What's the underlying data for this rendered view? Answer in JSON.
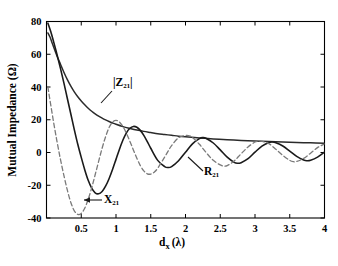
{
  "figure": {
    "background": "#ffffff",
    "axis_color": "#000000",
    "width": 338,
    "height": 266
  },
  "chart_data": {
    "type": "line",
    "title": "",
    "xlabel": "d_x (λ)",
    "xlabel_parts": {
      "base": "d",
      "sub": "x",
      "unit": "(λ)"
    },
    "ylabel": "Mutual Impedance (Ω)",
    "xlim": [
      0,
      4
    ],
    "ylim": [
      -40,
      80
    ],
    "xticks": [
      0,
      0.5,
      1,
      1.5,
      2,
      2.5,
      3,
      3.5,
      4
    ],
    "xticklabels": [
      "",
      "0.5",
      "1",
      "1.5",
      "2",
      "2.5",
      "3",
      "3.5",
      "4"
    ],
    "yticks": [
      -40,
      -20,
      0,
      20,
      40,
      60,
      80
    ],
    "yticklabels": [
      "-40",
      "-20",
      "0",
      "20",
      "40",
      "60",
      "80"
    ],
    "grid": false,
    "legend_position": "inline-annotations",
    "series": [
      {
        "name": "|Z21|",
        "label": "|Z₂₁|",
        "style": "solid",
        "color": "#2b2b2b",
        "width": 1.5,
        "description": "monotonically decaying magnitude envelope",
        "x": [
          0.02,
          0.05,
          0.08,
          0.12,
          0.16,
          0.2,
          0.25,
          0.3,
          0.35,
          0.4,
          0.45,
          0.5,
          0.55,
          0.6,
          0.65,
          0.7,
          0.75,
          0.8,
          0.85,
          0.9,
          0.95,
          1.0,
          1.1,
          1.2,
          1.3,
          1.4,
          1.5,
          1.6,
          1.7,
          1.8,
          1.9,
          2.0,
          2.2,
          2.4,
          2.6,
          2.8,
          3.0,
          3.2,
          3.4,
          3.6,
          3.8,
          4.0
        ],
        "y": [
          73.0,
          70.5,
          67.0,
          62.5,
          58.0,
          54.0,
          49.0,
          44.5,
          40.5,
          37.0,
          34.0,
          31.4,
          29.1,
          27.0,
          25.2,
          23.6,
          22.2,
          21.0,
          19.9,
          18.9,
          18.0,
          17.2,
          15.8,
          14.7,
          13.7,
          12.9,
          12.2,
          11.5,
          11.0,
          10.5,
          10.0,
          9.6,
          8.9,
          8.3,
          7.8,
          7.4,
          7.0,
          6.7,
          6.4,
          6.1,
          5.9,
          5.7
        ]
      },
      {
        "name": "R21",
        "label": "R₂₁",
        "style": "solid",
        "color": "#1a1a1a",
        "width": 1.6,
        "description": "real part, damped oscillation",
        "x": [
          0.02,
          0.06,
          0.1,
          0.15,
          0.2,
          0.25,
          0.3,
          0.35,
          0.4,
          0.45,
          0.5,
          0.55,
          0.6,
          0.65,
          0.7,
          0.75,
          0.8,
          0.85,
          0.9,
          0.95,
          1.0,
          1.05,
          1.1,
          1.15,
          1.2,
          1.25,
          1.3,
          1.35,
          1.4,
          1.45,
          1.5,
          1.6,
          1.7,
          1.75,
          1.8,
          1.9,
          2.0,
          2.1,
          2.2,
          2.25,
          2.3,
          2.4,
          2.5,
          2.6,
          2.7,
          2.75,
          2.8,
          2.9,
          3.0,
          3.1,
          3.2,
          3.25,
          3.3,
          3.4,
          3.5,
          3.6,
          3.7,
          3.75,
          3.8,
          3.9,
          4.0
        ],
        "y": [
          79.0,
          74.0,
          68.0,
          60.0,
          51.5,
          42.5,
          33.0,
          23.5,
          14.0,
          5.0,
          -3.0,
          -10.5,
          -17.0,
          -21.8,
          -24.6,
          -25.2,
          -23.8,
          -20.6,
          -16.0,
          -10.4,
          -4.2,
          2.0,
          7.6,
          12.0,
          14.8,
          15.9,
          15.4,
          13.5,
          10.5,
          6.7,
          2.6,
          -4.8,
          -8.6,
          -9.2,
          -8.6,
          -5.0,
          0.2,
          5.3,
          8.5,
          9.1,
          8.6,
          5.8,
          1.6,
          -2.8,
          -6.0,
          -6.6,
          -6.2,
          -3.8,
          0.2,
          3.9,
          6.1,
          6.4,
          6.0,
          4.0,
          0.8,
          -2.4,
          -4.6,
          -5.0,
          -4.7,
          -2.8,
          0.2
        ]
      },
      {
        "name": "X21",
        "label": "X₂₁",
        "style": "dashed",
        "color": "#7a7a7a",
        "width": 1.3,
        "description": "imaginary part, damped oscillation shifted in phase",
        "x": [
          0.02,
          0.05,
          0.1,
          0.15,
          0.2,
          0.25,
          0.3,
          0.35,
          0.4,
          0.45,
          0.5,
          0.55,
          0.6,
          0.65,
          0.7,
          0.75,
          0.8,
          0.85,
          0.9,
          0.95,
          1.0,
          1.05,
          1.1,
          1.15,
          1.2,
          1.25,
          1.3,
          1.35,
          1.4,
          1.45,
          1.5,
          1.55,
          1.6,
          1.7,
          1.75,
          1.8,
          1.9,
          2.0,
          2.05,
          2.1,
          2.2,
          2.3,
          2.4,
          2.5,
          2.55,
          2.6,
          2.7,
          2.8,
          2.9,
          3.0,
          3.05,
          3.1,
          3.2,
          3.3,
          3.4,
          3.5,
          3.55,
          3.6,
          3.7,
          3.8,
          3.9,
          4.0
        ],
        "y": [
          40.0,
          32.0,
          19.0,
          7.0,
          -4.0,
          -14.0,
          -23.0,
          -30.5,
          -35.6,
          -37.8,
          -37.2,
          -34.0,
          -28.6,
          -21.6,
          -13.6,
          -5.4,
          2.6,
          9.6,
          15.2,
          18.6,
          19.6,
          18.6,
          15.8,
          11.7,
          6.8,
          1.6,
          -3.5,
          -8.0,
          -11.2,
          -13.0,
          -13.2,
          -12.0,
          -9.6,
          -2.8,
          0.8,
          4.2,
          9.0,
          10.4,
          10.2,
          9.2,
          5.0,
          -0.2,
          -4.8,
          -7.6,
          -8.2,
          -8.0,
          -5.2,
          -0.8,
          3.4,
          6.4,
          6.9,
          6.8,
          5.4,
          2.0,
          -1.8,
          -4.8,
          -5.6,
          -5.5,
          -3.6,
          -0.4,
          3.0,
          5.2
        ]
      }
    ],
    "annotations": [
      {
        "name": "z21-label",
        "text": "|Z₂₁|",
        "x_px": 113,
        "y_px": 86
      },
      {
        "name": "r21-label",
        "text": "R₂₁",
        "x_px": 204,
        "y_px": 175
      },
      {
        "name": "x21-label",
        "text": "X₂₁",
        "x_px": 104,
        "y_px": 203
      }
    ]
  }
}
